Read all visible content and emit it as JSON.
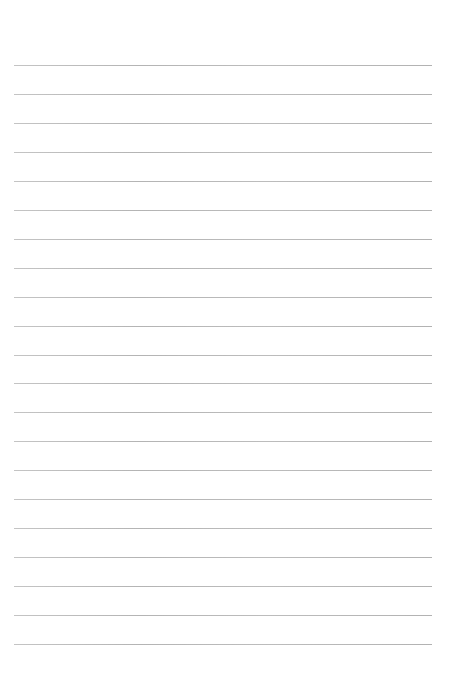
{
  "page": {
    "type": "lined-paper",
    "background_color": "#ffffff",
    "line_color": "#b8b8b8",
    "line_count": 21,
    "first_line_y": 65,
    "line_spacing": 28.95,
    "line_left_x": 14,
    "line_right_x": 432,
    "text": ""
  }
}
